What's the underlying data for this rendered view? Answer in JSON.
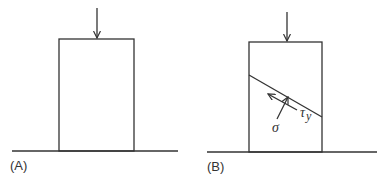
{
  "panels": [
    {
      "id": "A",
      "label": "(A)",
      "description": "Block on ground under vertical compressive load"
    },
    {
      "id": "B",
      "label": "(B)",
      "description": "Block with inclined shear plane showing normal and shear stress",
      "normal_stress_label": "σ",
      "shear_stress_symbol": "τ",
      "shear_stress_subscript": "y"
    }
  ],
  "colors": {
    "line": "#333333",
    "background": "#ffffff"
  }
}
